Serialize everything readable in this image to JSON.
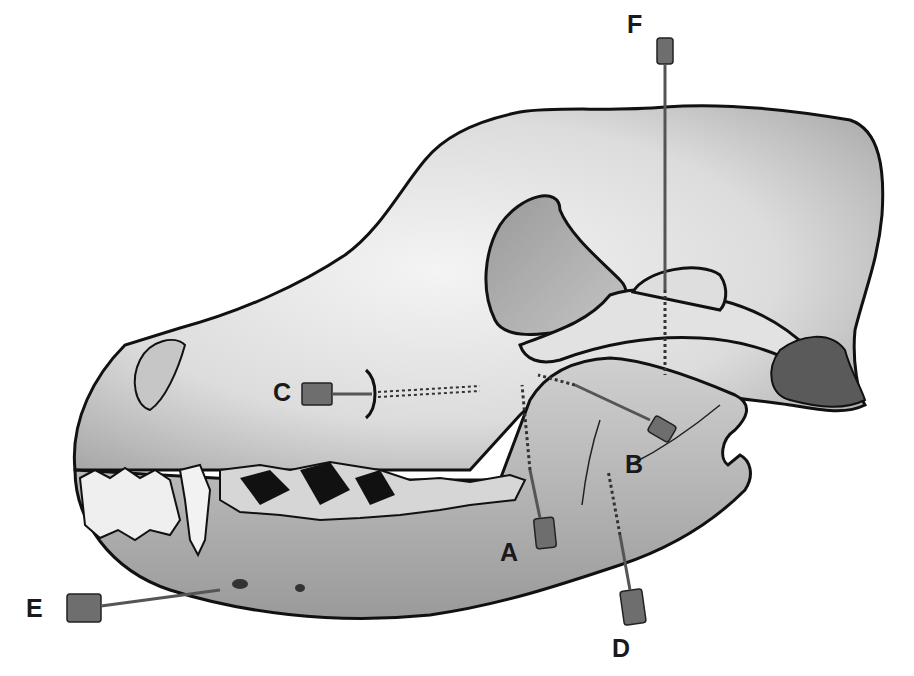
{
  "figure": {
    "labels": [
      {
        "id": "A",
        "text": "A",
        "x": 500,
        "y": 540
      },
      {
        "id": "B",
        "text": "B",
        "x": 625,
        "y": 452
      },
      {
        "id": "C",
        "text": "C",
        "x": 273,
        "y": 380
      },
      {
        "id": "D",
        "text": "D",
        "x": 612,
        "y": 636
      },
      {
        "id": "E",
        "text": "E",
        "x": 26,
        "y": 596
      },
      {
        "id": "F",
        "text": "F",
        "x": 627,
        "y": 12
      }
    ],
    "colors": {
      "outline": "#111111",
      "bone_light": "#e8e8e8",
      "bone_mid": "#bdbdbd",
      "bone_dark": "#8a8a8a",
      "needle_hub": "#6e6e6e",
      "background": "#ffffff"
    }
  }
}
